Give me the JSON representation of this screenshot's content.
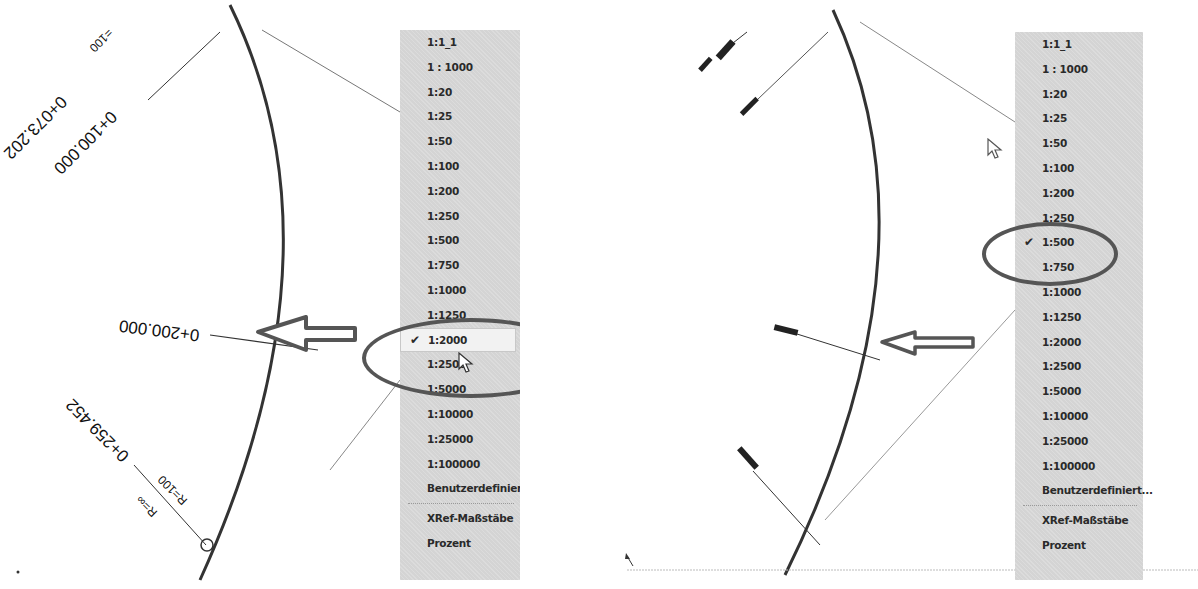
{
  "left_panel": {
    "drawing_labels": {
      "station_1": "0+100.000",
      "station_2": "0+073.202",
      "station_2_radius": "=100",
      "station_3": "0+200.000",
      "station_4": "0+259.452",
      "radius_a": "R=100",
      "radius_b": "R=∞"
    },
    "scale_menu": {
      "items": [
        {
          "label": "1:1_1",
          "checked": false
        },
        {
          "label": "1 : 1000",
          "checked": false
        },
        {
          "label": "1:20",
          "checked": false
        },
        {
          "label": "1:25",
          "checked": false
        },
        {
          "label": "1:50",
          "checked": false
        },
        {
          "label": "1:100",
          "checked": false
        },
        {
          "label": "1:200",
          "checked": false
        },
        {
          "label": "1:250",
          "checked": false
        },
        {
          "label": "1:500",
          "checked": false
        },
        {
          "label": "1:750",
          "checked": false
        },
        {
          "label": "1:1000",
          "checked": false
        },
        {
          "label": "1:1250",
          "checked": false
        },
        {
          "label": "1:2000",
          "checked": true
        },
        {
          "label": "1:2500",
          "checked": false
        },
        {
          "label": "1:5000",
          "checked": false
        },
        {
          "label": "1:10000",
          "checked": false
        },
        {
          "label": "1:25000",
          "checked": false
        },
        {
          "label": "1:100000",
          "checked": false
        },
        {
          "label": "Benutzerdefiniert...",
          "checked": false
        }
      ],
      "extra_items": [
        {
          "label": "XRef-Maßstäbe"
        },
        {
          "label": "Prozent"
        }
      ],
      "check_glyph": "✔"
    }
  },
  "right_panel": {
    "scale_menu": {
      "items": [
        {
          "label": "1:1_1",
          "checked": false
        },
        {
          "label": "1 : 1000",
          "checked": false
        },
        {
          "label": "1:20",
          "checked": false
        },
        {
          "label": "1:25",
          "checked": false
        },
        {
          "label": "1:50",
          "checked": false
        },
        {
          "label": "1:100",
          "checked": false
        },
        {
          "label": "1:200",
          "checked": false
        },
        {
          "label": "1:250",
          "checked": false
        },
        {
          "label": "1:500",
          "checked": true
        },
        {
          "label": "1:750",
          "checked": false
        },
        {
          "label": "1:1000",
          "checked": false
        },
        {
          "label": "1:1250",
          "checked": false
        },
        {
          "label": "1:2000",
          "checked": false
        },
        {
          "label": "1:2500",
          "checked": false
        },
        {
          "label": "1:5000",
          "checked": false
        },
        {
          "label": "1:10000",
          "checked": false
        },
        {
          "label": "1:25000",
          "checked": false
        },
        {
          "label": "1:100000",
          "checked": false
        },
        {
          "label": "Benutzerdefiniert...",
          "checked": false
        }
      ],
      "extra_items": [
        {
          "label": "XRef-Maßstäbe"
        },
        {
          "label": "Prozent"
        }
      ],
      "check_glyph": "✔"
    }
  },
  "colors": {
    "menu_bg": "#d4d4d4",
    "annotation": "#555555",
    "line": "#333333"
  }
}
